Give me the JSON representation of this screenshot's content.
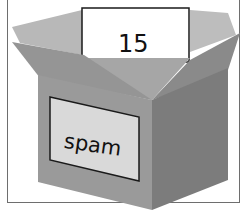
{
  "figure": {
    "box_label": "spam",
    "stored_value": "15"
  },
  "colors": {
    "box_front": "#9a9a9a",
    "box_side": "#7c7c7c",
    "flap_light": "#b4b4b4",
    "flap_dark": "#8e8e8e",
    "label_bg": "#d9d9d9",
    "card_bg": "#ffffff",
    "outline": "#1a1a1a"
  }
}
